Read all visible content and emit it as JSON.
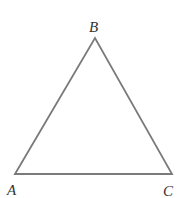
{
  "diagram": {
    "type": "triangle",
    "stroke_color": "#7a7a7a",
    "vertices": [
      {
        "label": "A",
        "x": 15,
        "y": 174,
        "label_x": 7,
        "label_y": 195
      },
      {
        "label": "B",
        "x": 95,
        "y": 38,
        "label_x": 89,
        "label_y": 32
      },
      {
        "label": "C",
        "x": 172,
        "y": 174,
        "label_x": 163,
        "label_y": 196
      }
    ]
  }
}
